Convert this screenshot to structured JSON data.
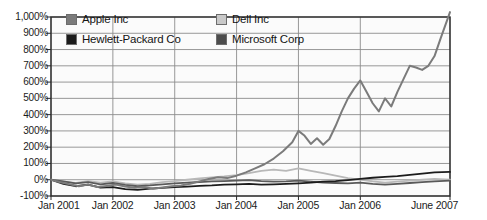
{
  "chart_data": {
    "type": "line",
    "title": "",
    "subtitle": "",
    "xlabel": "",
    "ylabel": "",
    "grid": true,
    "legend_position": "top-inside",
    "ylim": [
      -100,
      1000
    ],
    "ytick_labels": [
      "1,000%",
      "900%",
      "800%",
      "700%",
      "600%",
      "500%",
      "400%",
      "300%",
      "200%",
      "100%",
      "0%",
      "-100%"
    ],
    "ytick_values": [
      1000,
      900,
      800,
      700,
      600,
      500,
      400,
      300,
      200,
      100,
      0,
      -100
    ],
    "xtick_labels": [
      "Jan 2001",
      "Jan 2002",
      "Jan 2003",
      "Jan 2004",
      "Jan 2005",
      "Jan 2006",
      "June 2007"
    ],
    "xtick_values": [
      2001.0,
      2002.0,
      2003.0,
      2004.0,
      2005.0,
      2006.0,
      2007.45
    ],
    "xlim": [
      2001.0,
      2007.45
    ],
    "series": [
      {
        "name": "Apple Inc",
        "color": "#7b7b7b",
        "x": [
          2001.0,
          2001.15,
          2001.3,
          2001.45,
          2001.6,
          2001.75,
          2001.9,
          2002.05,
          2002.2,
          2002.35,
          2002.5,
          2002.65,
          2002.8,
          2002.95,
          2003.1,
          2003.25,
          2003.4,
          2003.55,
          2003.7,
          2003.85,
          2004.0,
          2004.15,
          2004.3,
          2004.45,
          2004.6,
          2004.75,
          2004.9,
          2005.0,
          2005.1,
          2005.2,
          2005.3,
          2005.4,
          2005.5,
          2005.6,
          2005.7,
          2005.8,
          2005.9,
          2006.0,
          2006.1,
          2006.2,
          2006.3,
          2006.4,
          2006.5,
          2006.6,
          2006.7,
          2006.8,
          2006.9,
          2007.0,
          2007.1,
          2007.2,
          2007.3,
          2007.45
        ],
        "y": [
          0,
          -15,
          -28,
          -40,
          -30,
          -45,
          -38,
          -30,
          -42,
          -50,
          -45,
          -55,
          -48,
          -40,
          -35,
          -25,
          -10,
          5,
          15,
          10,
          25,
          45,
          70,
          95,
          130,
          175,
          230,
          300,
          270,
          220,
          255,
          215,
          250,
          330,
          420,
          500,
          560,
          610,
          540,
          470,
          420,
          500,
          450,
          540,
          620,
          700,
          690,
          675,
          700,
          760,
          870,
          1030
        ]
      },
      {
        "name": "Dell Inc",
        "color": "#b8b8b8",
        "x": [
          2001.0,
          2001.2,
          2001.4,
          2001.6,
          2001.8,
          2002.0,
          2002.2,
          2002.4,
          2002.6,
          2002.8,
          2003.0,
          2003.2,
          2003.4,
          2003.6,
          2003.8,
          2004.0,
          2004.2,
          2004.4,
          2004.6,
          2004.8,
          2005.0,
          2005.2,
          2005.4,
          2005.6,
          2005.8,
          2006.0,
          2006.2,
          2006.4,
          2006.6,
          2006.8,
          2007.0,
          2007.2,
          2007.45
        ],
        "y": [
          0,
          -12,
          -20,
          -8,
          -18,
          -10,
          -22,
          -30,
          -25,
          -15,
          -8,
          0,
          8,
          14,
          20,
          28,
          40,
          55,
          62,
          55,
          70,
          55,
          40,
          25,
          10,
          0,
          -10,
          -18,
          -12,
          -5,
          0,
          5,
          0
        ]
      },
      {
        "name": "Hewlett-Packard Co",
        "color": "#1c1c1c",
        "x": [
          2001.0,
          2001.2,
          2001.4,
          2001.6,
          2001.8,
          2002.0,
          2002.2,
          2002.4,
          2002.6,
          2002.8,
          2003.0,
          2003.2,
          2003.4,
          2003.6,
          2003.8,
          2004.0,
          2004.2,
          2004.4,
          2004.6,
          2004.8,
          2005.0,
          2005.2,
          2005.4,
          2005.6,
          2005.8,
          2006.0,
          2006.2,
          2006.4,
          2006.6,
          2006.8,
          2007.0,
          2007.2,
          2007.45
        ],
        "y": [
          0,
          -25,
          -40,
          -30,
          -48,
          -45,
          -58,
          -62,
          -55,
          -50,
          -45,
          -42,
          -38,
          -35,
          -30,
          -28,
          -25,
          -30,
          -28,
          -25,
          -22,
          -18,
          -12,
          -8,
          -2,
          5,
          12,
          18,
          22,
          30,
          38,
          45,
          48
        ]
      },
      {
        "name": "Microsoft Corp",
        "color": "#5a5a5a",
        "x": [
          2001.0,
          2001.2,
          2001.4,
          2001.6,
          2001.8,
          2002.0,
          2002.2,
          2002.4,
          2002.6,
          2002.8,
          2003.0,
          2003.2,
          2003.4,
          2003.6,
          2003.8,
          2004.0,
          2004.2,
          2004.4,
          2004.6,
          2004.8,
          2005.0,
          2005.2,
          2005.4,
          2005.6,
          2005.8,
          2006.0,
          2006.2,
          2006.4,
          2006.6,
          2006.8,
          2007.0,
          2007.2,
          2007.45
        ],
        "y": [
          0,
          -10,
          -22,
          -15,
          -28,
          -20,
          -32,
          -40,
          -35,
          -28,
          -22,
          -18,
          -14,
          -10,
          -8,
          -5,
          -2,
          -8,
          -12,
          -10,
          -5,
          -12,
          -18,
          -20,
          -22,
          -18,
          -25,
          -30,
          -25,
          -20,
          -15,
          -10,
          -5
        ]
      }
    ]
  },
  "legend": {
    "entries": [
      {
        "label": "Apple Inc",
        "color": "#7b7b7b"
      },
      {
        "label": "Dell Inc",
        "color": "#c9c9c9"
      },
      {
        "label": "Hewlett-Packard Co",
        "color": "#1c1c1c"
      },
      {
        "label": "Microsoft Corp",
        "color": "#4d4d4d"
      }
    ]
  },
  "axes": {
    "y_labels": [
      "1,000%",
      "900%",
      "800%",
      "700%",
      "600%",
      "500%",
      "400%",
      "300%",
      "200%",
      "100%",
      "0%",
      "-100%"
    ],
    "x_labels": [
      "Jan 2001",
      "Jan 2002",
      "Jan 2003",
      "Jan 2004",
      "Jan 2005",
      "Jan 2006",
      "June 2007"
    ]
  },
  "colors": {
    "plot_background": "#fbfbfb",
    "grid": "#8c8c8c",
    "axis": "#2a2a2a",
    "text": "#1b1b1b"
  }
}
